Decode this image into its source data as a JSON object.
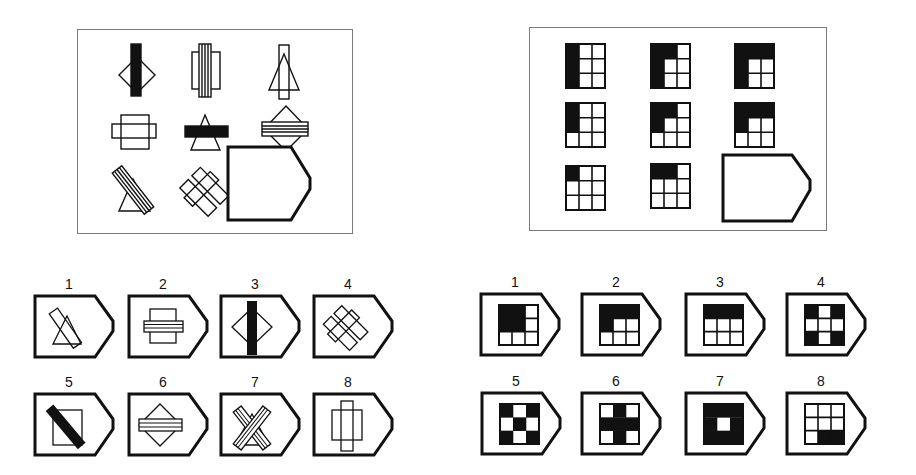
{
  "puzzles": [
    {
      "id": "left",
      "matrix": [
        "diamond-with-black-vertical-bar",
        "rectangle-with-striped-vertical-bar",
        "triangle-with-outline-vertical-bar",
        "square-with-outline-horizontal-bar",
        "triangle-with-black-horizontal-bar",
        "diamond-with-striped-horizontal-bar",
        "triangle-with-striped-diagonal-bar",
        "two-diagonal-outline-bars-crossed",
        "missing"
      ],
      "options": [
        {
          "label": "1",
          "figure": "triangle-with-outline-diagonal-bar"
        },
        {
          "label": "2",
          "figure": "square-with-striped-horizontal-bar"
        },
        {
          "label": "3",
          "figure": "diamond-with-black-vertical-bar"
        },
        {
          "label": "4",
          "figure": "two-diagonal-outline-bars-crossed"
        },
        {
          "label": "5",
          "figure": "square-with-black-diagonal-bar"
        },
        {
          "label": "6",
          "figure": "diamond-with-striped-horizontal-bar"
        },
        {
          "label": "7",
          "figure": "triangle-with-two-striped-crossed-bars"
        },
        {
          "label": "8",
          "figure": "rectangle-with-outline-vertical-bar"
        }
      ]
    },
    {
      "id": "right",
      "matrix": [
        "grid-left-column-black",
        "grid-L-top2-left3-black",
        "grid-top-row-and-left-column-black",
        "grid-left-column-top2-black",
        "grid-top-left-2x2-plus-left-top2",
        "grid-top-row-and-left-2",
        "grid-top-left-cell-black",
        "grid-top-left-two-cells-black",
        "missing"
      ],
      "options": [
        {
          "label": "1",
          "figure": "grid-top-left-2x2-black"
        },
        {
          "label": "2",
          "figure": "grid-top-row-and-left-middle-black"
        },
        {
          "label": "3",
          "figure": "grid-top-row-black"
        },
        {
          "label": "4",
          "figure": "grid-corners-black"
        },
        {
          "label": "5",
          "figure": "grid-corners-and-center-black"
        },
        {
          "label": "6",
          "figure": "grid-cross-black"
        },
        {
          "label": "7",
          "figure": "grid-ring-black"
        },
        {
          "label": "8",
          "figure": "grid-bottom-right-two-black"
        }
      ]
    }
  ]
}
